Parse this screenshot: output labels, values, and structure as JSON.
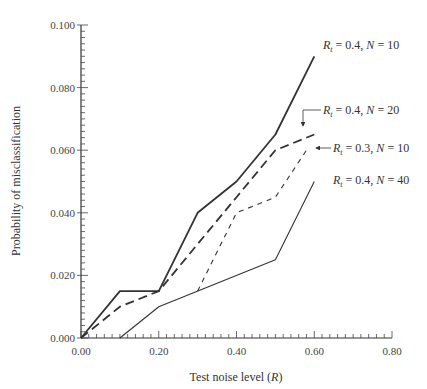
{
  "chart_data": {
    "type": "line",
    "title": "",
    "xlabel": "Test noise level (R)",
    "xlabel_parts": {
      "text": "Test noise level (",
      "var": "R",
      "close": ")"
    },
    "ylabel": "Probability of misclassification",
    "xlim": [
      0.0,
      0.8
    ],
    "ylim": [
      0.0,
      0.1
    ],
    "x_ticks": [
      "0.00",
      "0.20",
      "0.40",
      "0.60",
      "0.80"
    ],
    "y_ticks": [
      "0.000",
      "0.020",
      "0.040",
      "0.060",
      "0.080",
      "0.100"
    ],
    "grid": false,
    "legend_position": "inline-right",
    "series": [
      {
        "name": "R_t = 0.4, N = 10",
        "label": {
          "rt": "0.4",
          "n": "10"
        },
        "style": "solid-thick",
        "x": [
          0.0,
          0.1,
          0.2,
          0.3,
          0.4,
          0.5,
          0.6
        ],
        "values": [
          0.0,
          0.015,
          0.015,
          0.04,
          0.05,
          0.065,
          0.09
        ]
      },
      {
        "name": "R_t = 0.4, N = 20",
        "label": {
          "rt": "0.4",
          "n": "20"
        },
        "style": "long-dash",
        "x": [
          0.0,
          0.1,
          0.2,
          0.3,
          0.4,
          0.5,
          0.6
        ],
        "values": [
          0.0,
          0.01,
          0.015,
          0.03,
          0.045,
          0.06,
          0.065
        ]
      },
      {
        "name": "R_t = 0.3, N = 10",
        "label": {
          "rt": "0.3",
          "n": "10"
        },
        "style": "short-dash",
        "x": [
          0.3,
          0.4,
          0.5,
          0.58
        ],
        "values": [
          0.015,
          0.04,
          0.045,
          0.06
        ]
      },
      {
        "name": "R_t = 0.4, N = 40",
        "label": {
          "rt": "0.4",
          "n": "40"
        },
        "style": "solid-thin",
        "x": [
          0.1,
          0.2,
          0.5,
          0.6
        ],
        "values": [
          0.0,
          0.01,
          0.025,
          0.05
        ]
      }
    ]
  },
  "labels": {
    "r_symbol": "R",
    "t_sub": "t",
    "eq": " = ",
    "n_symbol": "N",
    "comma": ", "
  }
}
